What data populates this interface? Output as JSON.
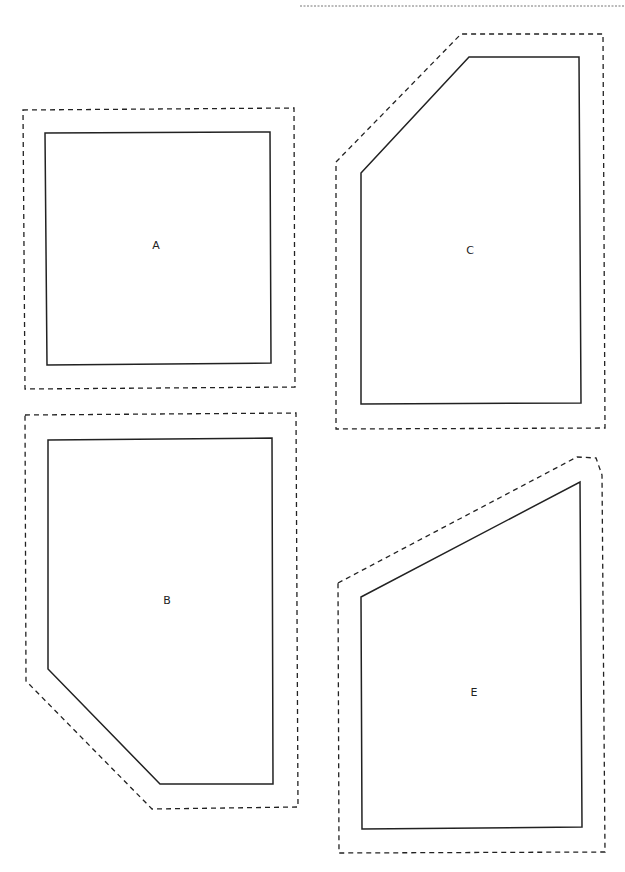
{
  "page": {
    "background": "#ffffff",
    "line_color": "#222222",
    "top_rule": {
      "x1": 300,
      "x2": 625,
      "y": 6
    }
  },
  "shapes": [
    {
      "id": "A",
      "label": "A",
      "label_pos": [
        156,
        245
      ],
      "outer": "23,110 294,108 295,387 25,389",
      "inner": "45,133 270,132 271,363 47,365"
    },
    {
      "id": "B",
      "label": "B",
      "label_pos": [
        167,
        600
      ],
      "outer": "25,415 296,413 298,807 152,809 26,681",
      "inner": "48,440 272,438 273,784 160,784 48,669"
    },
    {
      "id": "C",
      "label": "C",
      "label_pos": [
        470,
        250
      ],
      "outer": "336,162 461,34 603,34 605,428 336,429",
      "inner": "361,173 469,57 579,57 581,403 361,404"
    },
    {
      "id": "E",
      "label": "E",
      "label_pos": [
        474,
        692
      ],
      "outer": "338,583 577,457 596,458 602,475 605,852 339,853",
      "inner": "361,597 580,482 582,827 362,829"
    }
  ]
}
